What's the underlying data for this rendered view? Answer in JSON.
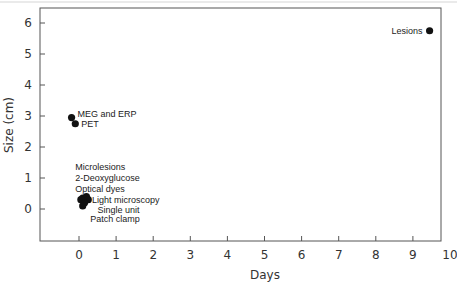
{
  "chart_data": {
    "type": "scatter",
    "title": "",
    "xlabel": "Days",
    "ylabel": "Size (cm)",
    "xlim": [
      -1,
      10
    ],
    "ylim": [
      -1,
      6.5
    ],
    "x_ticks": [
      0,
      1,
      2,
      3,
      4,
      5,
      6,
      7,
      8,
      9,
      10
    ],
    "y_ticks": [
      0,
      1,
      2,
      3,
      4,
      5,
      6
    ],
    "grid": false,
    "legend": "none",
    "points": [
      {
        "label": "Lesions",
        "x": 9.45,
        "y": 5.75,
        "label_side": "left"
      },
      {
        "label": "MEG and ERP",
        "x": -0.2,
        "y": 2.95,
        "label_side": "right"
      },
      {
        "label": "PET",
        "x": -0.1,
        "y": 2.75,
        "label_side": "right"
      },
      {
        "label": "Microlesions",
        "x": 0.1,
        "y": 0.35,
        "label_side": "stack"
      },
      {
        "label": "2-Deoxyglucose",
        "x": 0.2,
        "y": 0.4,
        "label_side": "stack"
      },
      {
        "label": "Optical dyes",
        "x": 0.05,
        "y": 0.3,
        "label_side": "stack"
      },
      {
        "label": "Light microscopy",
        "x": 0.25,
        "y": 0.3,
        "label_side": "stack"
      },
      {
        "label": "Single unit",
        "x": 0.15,
        "y": 0.2,
        "label_side": "stack"
      },
      {
        "label": "Patch clamp",
        "x": 0.1,
        "y": 0.1,
        "label_side": "stack"
      }
    ],
    "cluster_labels": [
      {
        "text": "Microlesions",
        "x": -0.1,
        "y": 1.35
      },
      {
        "text": "2-Deoxyglucose",
        "x": -0.1,
        "y": 1.0
      },
      {
        "text": "Optical dyes",
        "x": -0.1,
        "y": 0.65
      },
      {
        "text": "Light microscopy",
        "x": 0.35,
        "y": 0.3
      },
      {
        "text": "Single unit",
        "x": 0.5,
        "y": -0.02
      },
      {
        "text": "Patch clamp",
        "x": 0.3,
        "y": -0.32
      }
    ]
  },
  "colors": {
    "axis": "#555555",
    "point": "#111111",
    "text": "#222222"
  }
}
